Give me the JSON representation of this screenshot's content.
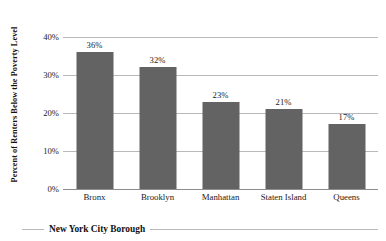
{
  "chart_data": {
    "type": "bar",
    "title": "",
    "xlabel": "New York City Borough",
    "ylabel": "Percent of Renters Below the Poverty Level",
    "categories": [
      "Bronx",
      "Brooklyn",
      "Manhattan",
      "Staten Island",
      "Queens"
    ],
    "values": [
      36,
      32,
      23,
      21,
      17
    ],
    "value_labels": [
      "36%",
      "32%",
      "23%",
      "21%",
      "17%"
    ],
    "ylim": [
      0,
      40
    ],
    "yticks": [
      40,
      30,
      20,
      10,
      0
    ],
    "ytick_labels": [
      "40%",
      "30%",
      "20%",
      "10%",
      "0%"
    ],
    "grid": true,
    "legend": "none",
    "series": [
      {
        "name": "Percent of Renters Below the Poverty Level",
        "values": [
          36,
          32,
          23,
          21,
          17
        ],
        "color": "#636363"
      }
    ],
    "colors": {
      "bar": "#636363",
      "gridline": "#b9b9b9",
      "axis": "#8d8d8d",
      "text": "#1a1a1a",
      "background": "#ffffff"
    }
  }
}
